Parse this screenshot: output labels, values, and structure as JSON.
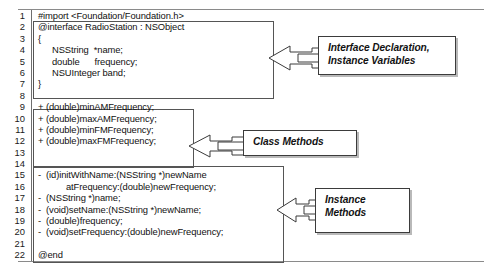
{
  "figure": {
    "kind": "code-listing-with-callouts",
    "language": "Objective-C"
  },
  "code": {
    "lines": [
      {
        "n": "1",
        "text": "#import <Foundation/Foundation.h>",
        "indent": 0
      },
      {
        "n": "2",
        "text": "@interface RadioStation : NSObject",
        "indent": 0
      },
      {
        "n": "3",
        "text": "{",
        "indent": 0
      },
      {
        "n": "4",
        "text": "NSString  *name;",
        "indent": 1
      },
      {
        "n": "5",
        "text": "double      frequency;",
        "indent": 1
      },
      {
        "n": "6",
        "text": "NSUInteger band;",
        "indent": 1
      },
      {
        "n": "7",
        "text": "}",
        "indent": 0
      },
      {
        "n": "8",
        "text": "",
        "indent": 0
      },
      {
        "n": "9",
        "text": "+ (double)minAMFrequency;",
        "indent": 0
      },
      {
        "n": "10",
        "text": "+ (double)maxAMFrequency;",
        "indent": 0
      },
      {
        "n": "11",
        "text": "+ (double)minFMFrequency;",
        "indent": 0
      },
      {
        "n": "12",
        "text": "+ (double)maxFMFrequency;",
        "indent": 0
      },
      {
        "n": "13",
        "text": "",
        "indent": 0
      },
      {
        "n": "14",
        "text": "",
        "indent": 0
      },
      {
        "n": "15",
        "text": "-  (id)initWithName:(NSString *)newName",
        "indent": 0
      },
      {
        "n": "16",
        "text": "atFrequency:(double)newFrequency;",
        "indent": 2
      },
      {
        "n": "17",
        "text": "-  (NSString *)name;",
        "indent": 0
      },
      {
        "n": "18",
        "text": "-  (void)setName:(NSString *)newName;",
        "indent": 0
      },
      {
        "n": "19",
        "text": "-  (double)frequency;",
        "indent": 0
      },
      {
        "n": "20",
        "text": "-  (void)setFrequency:(double)newFrequency;",
        "indent": 0
      },
      {
        "n": "21",
        "text": "",
        "indent": 0
      },
      {
        "n": "22",
        "text": "@end",
        "indent": 0
      }
    ]
  },
  "callouts": {
    "interface": {
      "line1": "Interface Declaration,",
      "line2": "Instance Variables"
    },
    "class_methods": {
      "line1": "Class Methods",
      "line2": ""
    },
    "instance_methods": {
      "line1": "Instance",
      "line2": "Methods"
    }
  },
  "colors": {
    "text": "#111111",
    "rule": "#8a8a8a",
    "box_border": "#555555",
    "callout_border": "#3b3b3b",
    "callout_shadow": "#b9b9b9"
  }
}
